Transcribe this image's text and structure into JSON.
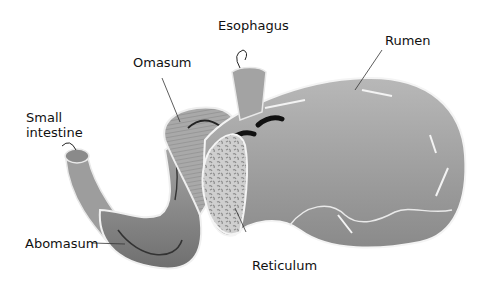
{
  "diagram": {
    "labels": {
      "esophagus": "Esophagus",
      "rumen": "Rumen",
      "omasum": "Omasum",
      "small_intestine": "Small\nintestine",
      "abomasum": "Abomasum",
      "reticulum": "Reticulum"
    },
    "colors": {
      "background": "#ffffff",
      "organ_fill_light": "#b5b5b5",
      "organ_fill_dark": "#7a7a7a",
      "outline": "#eeeeee",
      "text": "#111111"
    }
  }
}
